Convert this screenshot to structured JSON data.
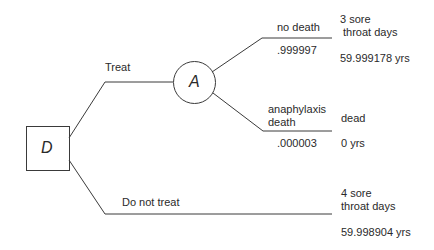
{
  "decision_node": {
    "label": "D"
  },
  "chance_node": {
    "label": "A"
  },
  "branches": {
    "treat": {
      "label": "Treat"
    },
    "do_not_treat": {
      "label": "Do not treat"
    },
    "no_death": {
      "label": "no death",
      "probability": ".999997"
    },
    "anaphylaxis_death": {
      "label_line1": "anaphylaxis",
      "label_line2": "death",
      "probability": ".000003"
    }
  },
  "outcomes": {
    "no_death": {
      "line1": "3 sore",
      "line2": "throat days",
      "value": "59.999178 yrs"
    },
    "anaphylaxis_death": {
      "line1": "dead",
      "value": "0 yrs"
    },
    "do_not_treat": {
      "line1": "4 sore",
      "line2": "throat days",
      "value": "59.998904 yrs"
    }
  },
  "colors": {
    "line": "#3a3a3a",
    "text": "#2a2a2a"
  }
}
